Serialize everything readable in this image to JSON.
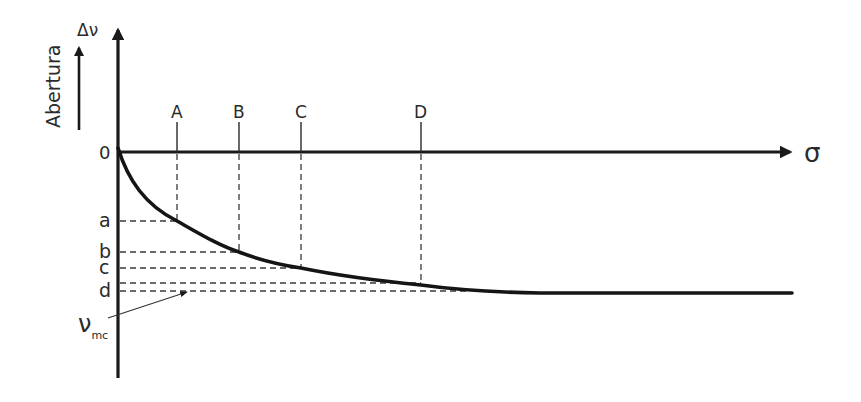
{
  "diagram": {
    "y_axis_title": "Abertura",
    "y_axis_symbol": "Δν",
    "x_axis_symbol": "σ",
    "origin_label": "0",
    "x_markers": [
      "A",
      "B",
      "C",
      "D"
    ],
    "y_markers": [
      "a",
      "b",
      "c",
      "d"
    ],
    "asymptote_label_main": "ν",
    "asymptote_label_sub": "mc"
  }
}
